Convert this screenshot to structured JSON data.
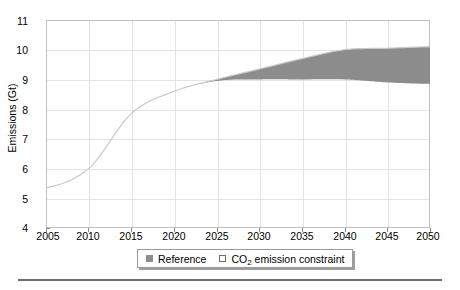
{
  "chart_data": {
    "type": "area",
    "title": "",
    "xlabel": "",
    "ylabel": "Emissions (Gt)",
    "xlim": [
      2005,
      2050
    ],
    "ylim": [
      4,
      11
    ],
    "grid": true,
    "legend_position": "bottom",
    "x_ticks": [
      "2005",
      "2010",
      "2015",
      "2020",
      "2025",
      "2030",
      "2035",
      "2040",
      "2045",
      "2050"
    ],
    "y_ticks": [
      "4",
      "5",
      "6",
      "7",
      "8",
      "9",
      "10",
      "11"
    ],
    "x": [
      2005,
      2010,
      2015,
      2020,
      2025,
      2030,
      2035,
      2040,
      2045,
      2050
    ],
    "series": [
      {
        "name": "Reference",
        "type": "line",
        "color": "#8c8c8c",
        "values": [
          5.35,
          6.0,
          7.85,
          8.6,
          9.0,
          9.35,
          9.7,
          10.0,
          10.05,
          10.1
        ]
      },
      {
        "name": "CO2 emission constraint",
        "type": "band-lower",
        "color": "#8c8c8c",
        "values": [
          5.35,
          6.0,
          7.85,
          8.6,
          8.95,
          9.0,
          9.0,
          9.0,
          8.9,
          8.85
        ]
      }
    ],
    "band": {
      "name": "CO2 emission constraint",
      "fill_color": "#8c8c8c",
      "upper": [
        5.35,
        6.0,
        7.85,
        8.6,
        9.0,
        9.35,
        9.7,
        10.0,
        10.05,
        10.1
      ],
      "lower": [
        5.35,
        6.0,
        7.85,
        8.6,
        8.95,
        9.0,
        9.0,
        9.0,
        8.9,
        8.85
      ]
    },
    "legend": [
      {
        "label": "Reference",
        "marker": "filled-square",
        "color": "#8c8c8c"
      },
      {
        "label_prefix": "CO",
        "label_sub": "2",
        "label_suffix": " emission constraint",
        "marker": "hollow-square",
        "color": "#ffffff"
      }
    ],
    "colors": {
      "line": "#c9c9c9",
      "band_fill": "#8c8c8c",
      "grid": "#e3e3e3",
      "axis": "#bfbfbf",
      "text": "#000000"
    }
  }
}
